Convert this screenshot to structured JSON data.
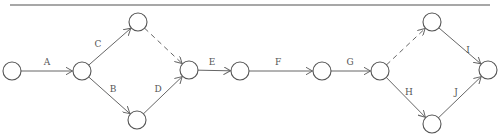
{
  "diagram": {
    "type": "activity-on-arrow network",
    "rule": {
      "x1": 10,
      "y1": 5,
      "x2": 490,
      "y2": 5
    },
    "node_radius": 9,
    "nodes": [
      {
        "id": "n1",
        "x": 12,
        "y": 71
      },
      {
        "id": "n2",
        "x": 82,
        "y": 71
      },
      {
        "id": "n3",
        "x": 138,
        "y": 22
      },
      {
        "id": "n4",
        "x": 137,
        "y": 120
      },
      {
        "id": "n5",
        "x": 189,
        "y": 70
      },
      {
        "id": "n6",
        "x": 240,
        "y": 71
      },
      {
        "id": "n7",
        "x": 322,
        "y": 71
      },
      {
        "id": "n8",
        "x": 380,
        "y": 71
      },
      {
        "id": "n9",
        "x": 432,
        "y": 22
      },
      {
        "id": "n10",
        "x": 432,
        "y": 124
      },
      {
        "id": "n11",
        "x": 488,
        "y": 70
      }
    ],
    "edges": [
      {
        "from": "n1",
        "to": "n2",
        "label": "A",
        "dashed": false,
        "lx": 47,
        "ly": 65
      },
      {
        "from": "n2",
        "to": "n3",
        "label": "C",
        "dashed": false,
        "lx": 98,
        "ly": 47
      },
      {
        "from": "n2",
        "to": "n4",
        "label": "B",
        "dashed": false,
        "lx": 113,
        "ly": 92
      },
      {
        "from": "n3",
        "to": "n5",
        "label": "",
        "dashed": true,
        "lx": 0,
        "ly": 0
      },
      {
        "from": "n4",
        "to": "n5",
        "label": "D",
        "dashed": false,
        "lx": 158,
        "ly": 92
      },
      {
        "from": "n5",
        "to": "n6",
        "label": "E",
        "dashed": false,
        "lx": 212,
        "ly": 65
      },
      {
        "from": "n6",
        "to": "n7",
        "label": "F",
        "dashed": false,
        "lx": 278,
        "ly": 65
      },
      {
        "from": "n7",
        "to": "n8",
        "label": "G",
        "dashed": false,
        "lx": 350,
        "ly": 65
      },
      {
        "from": "n8",
        "to": "n9",
        "label": "",
        "dashed": true,
        "lx": 0,
        "ly": 0
      },
      {
        "from": "n8",
        "to": "n10",
        "label": "H",
        "dashed": false,
        "lx": 409,
        "ly": 95
      },
      {
        "from": "n9",
        "to": "n11",
        "label": "I",
        "dashed": false,
        "lx": 468,
        "ly": 53
      },
      {
        "from": "n10",
        "to": "n11",
        "label": "J",
        "dashed": false,
        "lx": 456,
        "ly": 95
      }
    ]
  }
}
